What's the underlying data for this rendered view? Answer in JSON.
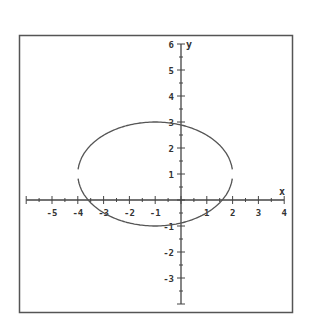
{
  "chart_data": {
    "type": "line",
    "title": "",
    "xlabel": "x",
    "ylabel": "y",
    "xlim": [
      -6,
      4
    ],
    "ylim": [
      -4,
      6
    ],
    "grid": false,
    "x_ticks": [
      -5,
      -4,
      -3,
      -2,
      -1,
      1,
      2,
      3,
      4
    ],
    "y_ticks": [
      6,
      5,
      4,
      3,
      2,
      1,
      -1,
      -2,
      -3
    ],
    "x_tick_labels": [
      "-5",
      "-4",
      "-3",
      "-2",
      "-1",
      "1",
      "2",
      "3",
      "4"
    ],
    "y_tick_labels": [
      "6",
      "5",
      "4",
      "3",
      "2",
      "1",
      "-1",
      "-2",
      "-3"
    ],
    "minor_ticks_per_unit": 2,
    "series": [
      {
        "name": "ellipse",
        "shape": "ellipse",
        "center": [
          -1,
          1
        ],
        "semi_axis_x": 3,
        "semi_axis_y": 2,
        "equation": "(x+1)^2/9 + (y-1)^2/4 = 1",
        "x_range": [
          -4,
          2
        ],
        "y_range": [
          -1,
          3
        ],
        "color": "#555555"
      }
    ]
  },
  "colors": {
    "frame": "#555555",
    "axes": "#444444",
    "curve": "#555555",
    "background": "#ffffff"
  }
}
